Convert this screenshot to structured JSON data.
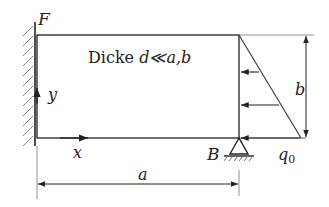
{
  "diagram": {
    "type": "mechanics-plate",
    "labels": {
      "corner_top_left": "F",
      "corner_bottom_right": "B",
      "thickness_prefix": "Dicke ",
      "thickness_expr": "d≪a,b",
      "axis_x": "x",
      "axis_y": "y",
      "dim_width": "a",
      "dim_height": "b",
      "load": "q",
      "load_subscript": "0"
    },
    "colors": {
      "line": "#222222",
      "thin_line": "#555555",
      "background": "#ffffff"
    }
  }
}
